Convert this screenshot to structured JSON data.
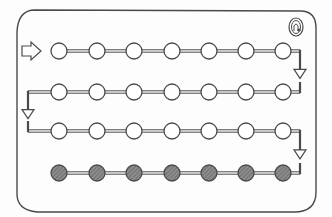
{
  "diagram": {
    "type": "serpentine-path-board",
    "colors": {
      "background": "#fdfdfd",
      "stroke": "#4a4a4a",
      "empty_fill": "#ffffff",
      "filled_fill": "#8c8c8c",
      "filled_hatch": "#5f5f5f"
    },
    "frame": {
      "x": 17,
      "y": 10,
      "width": 299,
      "height": 202
    },
    "start_marker": {
      "icon": "start-arrow-icon",
      "x": 22,
      "y": 51
    },
    "corner_icon": {
      "icon": "bell-icon",
      "x": 296,
      "y": 27
    },
    "columns_x": [
      59,
      97,
      134,
      172,
      209,
      246,
      283
    ],
    "rows": [
      {
        "y": 51,
        "state": "empty",
        "count": 7,
        "exit": "right-down"
      },
      {
        "y": 92,
        "state": "empty",
        "count": 7,
        "exit": "left-down"
      },
      {
        "y": 131,
        "state": "empty",
        "count": 7,
        "exit": "right-down"
      },
      {
        "y": 173,
        "state": "filled",
        "count": 7,
        "exit": "none"
      }
    ],
    "circle_radius": 8
  }
}
